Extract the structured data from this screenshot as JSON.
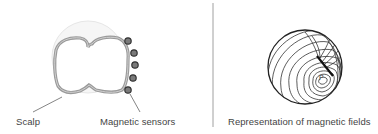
{
  "left_panel": {
    "labels": {
      "scalp": "Scalp",
      "sensors": "Magnetic sensors"
    },
    "sensor_count": 5
  },
  "right_panel": {
    "caption": "Representation of magnetic fields",
    "peak_marker": "P"
  },
  "colors": {
    "text": "#444444",
    "brain_outline": "#8a8a8a",
    "scalp_fill": "#f3f3f3",
    "sensor_fill": "#777777",
    "sensor_stroke": "#333333",
    "contour": "#333333",
    "divider": "#777777"
  }
}
